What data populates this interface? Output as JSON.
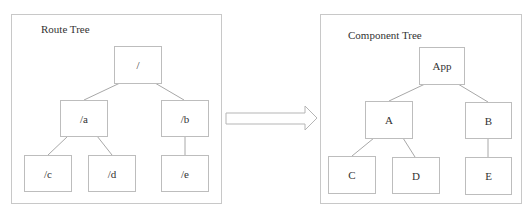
{
  "route_tree": {
    "title": "Route Tree",
    "nodes": {
      "root": "/",
      "a": "/a",
      "b": "/b",
      "c": "/c",
      "d": "/d",
      "e": "/e"
    }
  },
  "arrow": {
    "direction": "right",
    "icon": "right-arrow-icon"
  },
  "component_tree": {
    "title": "Component Tree",
    "nodes": {
      "root": "App",
      "a": "A",
      "b": "B",
      "c": "C",
      "d": "D",
      "e": "E"
    }
  },
  "colors": {
    "border": "#c8c8c8",
    "node_border": "#bdbdbd",
    "edge": "#a8a8a8",
    "text": "#333333"
  }
}
